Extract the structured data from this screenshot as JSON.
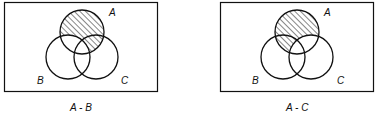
{
  "diagrams": [
    {
      "caption": "A - B",
      "labels": {
        "a": "A",
        "b": "B",
        "c": "C"
      },
      "shaded_region": "A minus B"
    },
    {
      "caption": "A - C",
      "labels": {
        "a": "A",
        "b": "B",
        "c": "C"
      },
      "shaded_region": "A minus C"
    }
  ],
  "colors": {
    "stroke": "#111111",
    "hatch": "#222222",
    "background": "#ffffff"
  }
}
